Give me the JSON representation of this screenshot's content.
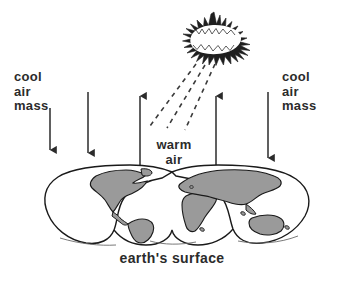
{
  "diagram": {
    "caption": "earth's surface",
    "labels": {
      "cool_air_mass_left": "cool\nair\nmass",
      "cool_air_mass_right": "cool\nair\nmass",
      "warm_air": "warm\nair"
    },
    "icons": {
      "sun": "sun-starburst-icon",
      "rays": "sun-rays-dashed-icon",
      "arrow_down": "arrow-down-icon",
      "arrow_up": "arrow-up-icon",
      "earth": "world-map-interrupted-projection-icon"
    },
    "colors": {
      "ink": "#2b2b2b",
      "outline": "#1a1a1a",
      "land_fill": "#9a9a9a",
      "ocean_fill": "#ffffff",
      "background": "#ffffff"
    },
    "arrows": [
      {
        "name": "cool-air-arrow-left-inner",
        "direction": "down",
        "x": 50,
        "y1": 108,
        "y2": 152
      },
      {
        "name": "cool-air-arrow-left-outer",
        "direction": "down",
        "x": 88,
        "y1": 92,
        "y2": 155
      },
      {
        "name": "warm-air-arrow-left",
        "direction": "up",
        "x": 140,
        "y1": 165,
        "y2": 94
      },
      {
        "name": "warm-air-arrow-right",
        "direction": "up",
        "x": 216,
        "y1": 165,
        "y2": 94
      },
      {
        "name": "cool-air-arrow-right",
        "direction": "down",
        "x": 268,
        "y1": 92,
        "y2": 160
      }
    ],
    "rays": [
      {
        "name": "sun-ray-1",
        "x1": 196,
        "y1": 64,
        "x2": 152,
        "y2": 124
      },
      {
        "name": "sun-ray-2",
        "x1": 204,
        "y1": 65,
        "x2": 168,
        "y2": 126
      },
      {
        "name": "sun-ray-3",
        "x1": 214,
        "y1": 64,
        "x2": 184,
        "y2": 128
      }
    ]
  }
}
